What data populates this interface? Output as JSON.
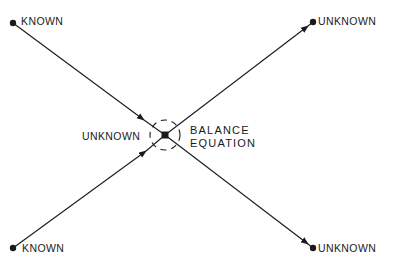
{
  "diagram": {
    "type": "balance-equation-node",
    "nodes": {
      "top_left": {
        "label": "KNOWN",
        "role": "input"
      },
      "bottom_left": {
        "label": "KNOWN",
        "role": "input"
      },
      "top_right": {
        "label": "UNKNOWN",
        "role": "output"
      },
      "bottom_right": {
        "label": "UNKNOWN",
        "role": "output"
      },
      "center": {
        "label": "UNKNOWN",
        "role": "junction"
      }
    },
    "center_annotation": {
      "line1": "BALANCE",
      "line2": "EQUATION"
    },
    "edges": [
      {
        "from": "top_left",
        "to": "center"
      },
      {
        "from": "bottom_left",
        "to": "center"
      },
      {
        "from": "center",
        "to": "top_right"
      },
      {
        "from": "center",
        "to": "bottom_right"
      }
    ],
    "colors": {
      "ink": "#1a1a1a",
      "background": "#ffffff"
    }
  }
}
